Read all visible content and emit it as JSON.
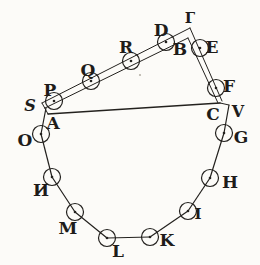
{
  "figure": {
    "name": "polygon-and-triangle-engraving",
    "width": 260,
    "height": 265,
    "ink_color": "#23211e",
    "paper_color": "#fcfbf8",
    "circle_radius": 8.5,
    "dot_radius": 1.3,
    "label_font_size": 17
  },
  "circled_vertices": [
    {
      "label": "P",
      "x": 54,
      "y": 101,
      "label_x": 50,
      "label_y": 90
    },
    {
      "label": "Q",
      "x": 91,
      "y": 81,
      "label_x": 88,
      "label_y": 70
    },
    {
      "label": "R",
      "x": 131,
      "y": 61,
      "label_x": 126,
      "label_y": 47
    },
    {
      "label": "D",
      "x": 166,
      "y": 42,
      "label_x": 161,
      "label_y": 30
    },
    {
      "label": "E",
      "x": 200,
      "y": 48,
      "label_x": 212,
      "label_y": 47
    },
    {
      "label": "F",
      "x": 216,
      "y": 88,
      "label_x": 229,
      "label_y": 86
    },
    {
      "label": "G",
      "x": 224,
      "y": 133,
      "label_x": 241,
      "label_y": 137
    },
    {
      "label": "H",
      "x": 210,
      "y": 178,
      "label_x": 230,
      "label_y": 182
    },
    {
      "label": "I",
      "x": 188,
      "y": 211,
      "label_x": 198,
      "label_y": 214,
      "size": 15
    },
    {
      "label": "K",
      "x": 150,
      "y": 237,
      "label_x": 167,
      "label_y": 240
    },
    {
      "label": "L",
      "x": 107,
      "y": 238,
      "label_x": 118,
      "label_y": 251
    },
    {
      "label": "M",
      "x": 75,
      "y": 212,
      "label_x": 68,
      "label_y": 228
    },
    {
      "label": "И",
      "x": 52,
      "y": 177,
      "label_x": 41,
      "label_y": 190
    },
    {
      "label": "O",
      "x": 41,
      "y": 134,
      "label_x": 25,
      "label_y": 140
    }
  ],
  "plain_points": [
    {
      "label": "Г",
      "label_x": 190,
      "label_y": 18,
      "size": 15
    },
    {
      "label": "B",
      "label_x": 180,
      "label_y": 49
    },
    {
      "label": "S",
      "label_x": 30,
      "label_y": 105,
      "size": 16,
      "italic": true
    },
    {
      "label": "A",
      "label_x": 53,
      "label_y": 123
    },
    {
      "label": "C",
      "label_x": 213,
      "label_y": 114
    },
    {
      "label": "V",
      "label_x": 238,
      "label_y": 111,
      "size": 16
    }
  ],
  "segments": [
    {
      "name": "side-A-O",
      "x1": 46,
      "y1": 108,
      "x2": 41,
      "y2": 134,
      "w": 1.2
    },
    {
      "name": "side-O-N",
      "x1": 41,
      "y1": 134,
      "x2": 52,
      "y2": 177,
      "w": 1.2
    },
    {
      "name": "side-N-M",
      "x1": 52,
      "y1": 177,
      "x2": 75,
      "y2": 212,
      "w": 1.2
    },
    {
      "name": "side-M-L",
      "x1": 75,
      "y1": 212,
      "x2": 107,
      "y2": 238,
      "w": 1.2
    },
    {
      "name": "side-L-K",
      "x1": 107,
      "y1": 238,
      "x2": 150,
      "y2": 237,
      "w": 1.2
    },
    {
      "name": "side-K-I",
      "x1": 150,
      "y1": 237,
      "x2": 188,
      "y2": 211,
      "w": 1.2
    },
    {
      "name": "side-I-H",
      "x1": 188,
      "y1": 211,
      "x2": 210,
      "y2": 178,
      "w": 1.2
    },
    {
      "name": "side-H-G",
      "x1": 210,
      "y1": 178,
      "x2": 224,
      "y2": 133,
      "w": 1.2
    },
    {
      "name": "side-G-V",
      "x1": 224,
      "y1": 133,
      "x2": 229,
      "y2": 105,
      "w": 1.2
    },
    {
      "name": "side-V-C",
      "x1": 229,
      "y1": 105,
      "x2": 220,
      "y2": 103,
      "w": 1.0
    },
    {
      "name": "base-A-C",
      "x1": 48,
      "y1": 114,
      "x2": 220,
      "y2": 103,
      "w": 1.5
    },
    {
      "name": "band-upper-left",
      "x1": 42,
      "y1": 103,
      "x2": 190,
      "y2": 28,
      "w": 1.0
    },
    {
      "name": "band-lower-left",
      "x1": 45,
      "y1": 108,
      "x2": 188,
      "y2": 38,
      "w": 1.0
    },
    {
      "name": "band-outer-right",
      "x1": 190,
      "y1": 28,
      "x2": 222,
      "y2": 101,
      "w": 1.0
    },
    {
      "name": "band-inner-right",
      "x1": 188,
      "y1": 38,
      "x2": 218,
      "y2": 103,
      "w": 1.0
    },
    {
      "name": "band-left-endcap",
      "x1": 42,
      "y1": 103,
      "x2": 48,
      "y2": 114,
      "w": 1.0
    }
  ],
  "speck": {
    "x": 140,
    "y": 75,
    "r": 1.1,
    "color": "#b6b2a8"
  }
}
